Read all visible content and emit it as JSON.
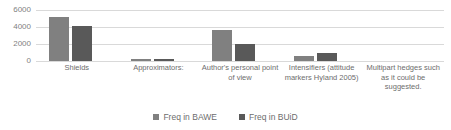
{
  "chart_data": {
    "type": "bar",
    "title": "",
    "subtitle": "",
    "xlabel": "",
    "ylabel": "",
    "ylim": [
      0,
      6000
    ],
    "yticks": [
      "0",
      "2000",
      "4000",
      "6000"
    ],
    "ytick_values": [
      0,
      2000,
      4000,
      6000
    ],
    "grid": true,
    "legend_position": "bottom",
    "categories": [
      "Shields",
      "Approximators:",
      "Author's personal point of view",
      "Intensifiers (attitude markers Hyland 2005)",
      "Multipart hedges such as it could be suggested."
    ],
    "series": [
      {
        "name": "Freq in BAWE",
        "color": "#808080",
        "values": [
          5200,
          250,
          3600,
          600,
          0
        ]
      },
      {
        "name": "Freq in BUiD",
        "color": "#595959",
        "values": [
          4100,
          200,
          2000,
          900,
          0
        ]
      }
    ]
  },
  "colors": {
    "series_bawe": "#808080",
    "series_buid": "#595959",
    "gridline": "#d9d9d9",
    "text": "#6d6d6d",
    "background": "#ffffff"
  }
}
